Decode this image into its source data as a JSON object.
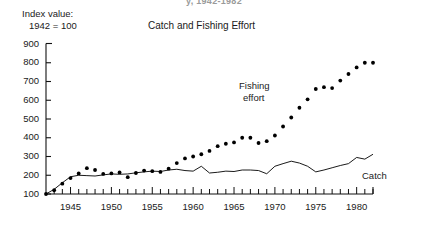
{
  "header": {
    "cropped_top_text": "y, 1942-1982"
  },
  "axis_caption": {
    "line1": "Index value:",
    "line2": "1942 = 100"
  },
  "labels": {
    "fishing_effort_line1": "Fishing",
    "fishing_effort_line2": "effort",
    "catch": "Catch"
  },
  "chart_data": {
    "type": "scatter",
    "title": "Catch and Fishing Effort",
    "xlabel": "",
    "ylabel": "Index value: 1942 = 100",
    "xlim": [
      1942,
      1982
    ],
    "ylim": [
      100,
      900
    ],
    "ytick_labels": [
      "100",
      "200",
      "300",
      "400",
      "500",
      "600",
      "700",
      "800",
      "900"
    ],
    "yticks": [
      100,
      200,
      300,
      400,
      500,
      600,
      700,
      800,
      900
    ],
    "xtick_labels": [
      "1945",
      "1950",
      "1955",
      "1960",
      "1965",
      "1970",
      "1975",
      "1980"
    ],
    "xticks": [
      1945,
      1950,
      1955,
      1960,
      1965,
      1970,
      1975,
      1980
    ],
    "minor_xticks_every": 1,
    "grid": false,
    "legend_position": "inline-annotations",
    "x": [
      1942,
      1943,
      1944,
      1945,
      1946,
      1947,
      1948,
      1949,
      1950,
      1951,
      1952,
      1953,
      1954,
      1955,
      1956,
      1957,
      1958,
      1959,
      1960,
      1961,
      1962,
      1963,
      1964,
      1965,
      1966,
      1967,
      1968,
      1969,
      1970,
      1971,
      1972,
      1973,
      1974,
      1975,
      1976,
      1977,
      1978,
      1979,
      1980,
      1981,
      1982
    ],
    "series": [
      {
        "name": "Fishing effort",
        "style": "dotted-markers",
        "color": "#000000",
        "values": [
          100,
          120,
          155,
          185,
          210,
          238,
          228,
          207,
          210,
          215,
          190,
          212,
          225,
          222,
          218,
          235,
          265,
          290,
          300,
          312,
          330,
          355,
          368,
          375,
          400,
          400,
          372,
          382,
          412,
          460,
          508,
          560,
          605,
          660,
          670,
          665,
          705,
          740,
          775,
          800,
          800
        ]
      },
      {
        "name": "Catch",
        "style": "line",
        "color": "#000000",
        "values": [
          100,
          125,
          160,
          192,
          200,
          198,
          196,
          202,
          207,
          205,
          207,
          213,
          218,
          222,
          220,
          228,
          232,
          225,
          222,
          248,
          212,
          216,
          222,
          220,
          228,
          228,
          225,
          208,
          248,
          262,
          275,
          265,
          248,
          218,
          222,
          228,
          235,
          248,
          256,
          268,
          282
        ]
      }
    ],
    "catch_extra": {
      "x": [
        1975,
        1976,
        1977,
        1978,
        1979,
        1980,
        1981,
        1982
      ],
      "values": [
        218,
        228,
        240,
        252,
        262,
        295,
        286,
        312
      ]
    }
  }
}
